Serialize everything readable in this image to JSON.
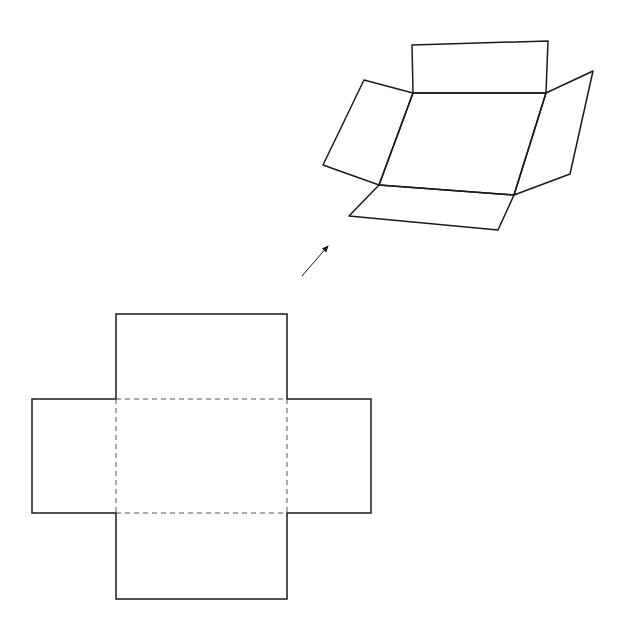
{
  "diagram": {
    "colors": {
      "stroke": "#1a1a1a",
      "background": "#ffffff"
    },
    "folded_box": {
      "top_flap": "412,45 548,41 546,93 413,93",
      "base": "413,93 546,93 514,195 379,185",
      "left_flap": "364,80 413,93 379,185 323,165",
      "right_flap": "546,93 593,71 570,174 514,195",
      "bottom_flap": "379,185 514,195 498,230 349,216"
    },
    "arrow": {
      "x1": 302,
      "y1": 276,
      "x2": 328,
      "y2": 246
    },
    "flat_net": {
      "outline": "116,314 287,314 287,399 371,399 371,513 287,513 287,599 116,599 116,513 32,513 32,399 116,399",
      "fold_lines": [
        {
          "x1": 116,
          "y1": 399,
          "x2": 287,
          "y2": 399
        },
        {
          "x1": 116,
          "y1": 513,
          "x2": 287,
          "y2": 513
        },
        {
          "x1": 116,
          "y1": 399,
          "x2": 116,
          "y2": 513
        },
        {
          "x1": 287,
          "y1": 399,
          "x2": 287,
          "y2": 513
        }
      ]
    }
  }
}
